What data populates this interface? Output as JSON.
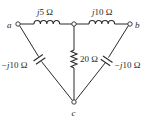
{
  "diagram": {
    "type": "circuit",
    "nodes": {
      "a": {
        "label": "a"
      },
      "b": {
        "label": "b"
      },
      "c": {
        "label": "c"
      },
      "mid": {
        "label": ""
      }
    },
    "components": [
      {
        "id": "L1",
        "kind": "inductor",
        "from": "a",
        "to": "mid",
        "label_prefix": "j",
        "label_value": "5 Ω"
      },
      {
        "id": "L2",
        "kind": "inductor",
        "from": "mid",
        "to": "b",
        "label_prefix": "j",
        "label_value": "10 Ω"
      },
      {
        "id": "R1",
        "kind": "resistor",
        "from": "mid",
        "to": "c",
        "label_value": "20 Ω"
      },
      {
        "id": "C1",
        "kind": "capacitor",
        "from": "a",
        "to": "c",
        "label_prefix": "−j",
        "label_value": "10 Ω"
      },
      {
        "id": "C2",
        "kind": "capacitor",
        "from": "b",
        "to": "c",
        "label_prefix": "−j",
        "label_value": "10 Ω"
      }
    ],
    "colors": {
      "ink": "#2a2a2a",
      "background": "#ffffff"
    }
  }
}
